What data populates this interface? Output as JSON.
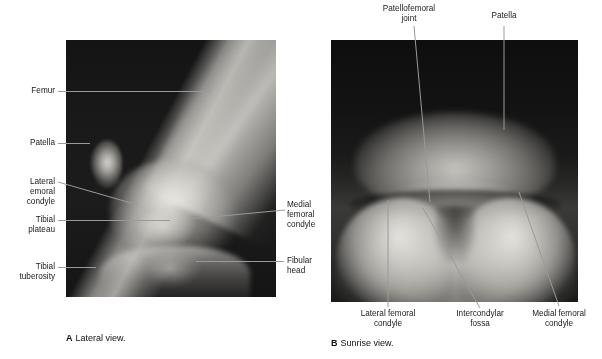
{
  "figure": {
    "background_color": "#ffffff",
    "leader_color_light": "#bdbdbd",
    "leader_color_dark": "#9a9a9a"
  },
  "panel_a": {
    "caption_mark": "A",
    "caption_text": "Lateral view.",
    "image_alt": "Lateral knee radiograph",
    "labels_left": [
      {
        "text": "Femur"
      },
      {
        "text": "Patella"
      },
      {
        "text": "Lateral\nemoral\ncondyle"
      },
      {
        "text": "Tibial\nplateau"
      },
      {
        "text": "Tibial\ntuberosity"
      }
    ],
    "labels_right": [
      {
        "text": "Medial\nfemoral\ncondyle"
      },
      {
        "text": "Fibular\nhead"
      }
    ]
  },
  "panel_b": {
    "caption_mark": "B",
    "caption_text": "Sunrise view.",
    "image_alt": "Sunrise (skyline) knee radiograph",
    "labels_top": [
      {
        "text": "Patellofemoral\njoint"
      },
      {
        "text": "Patella"
      }
    ],
    "labels_bottom": [
      {
        "text": "Lateral femoral\ncondyle"
      },
      {
        "text": "Intercondylar\nfossa"
      },
      {
        "text": "Medial femoral\ncondyle"
      }
    ]
  }
}
